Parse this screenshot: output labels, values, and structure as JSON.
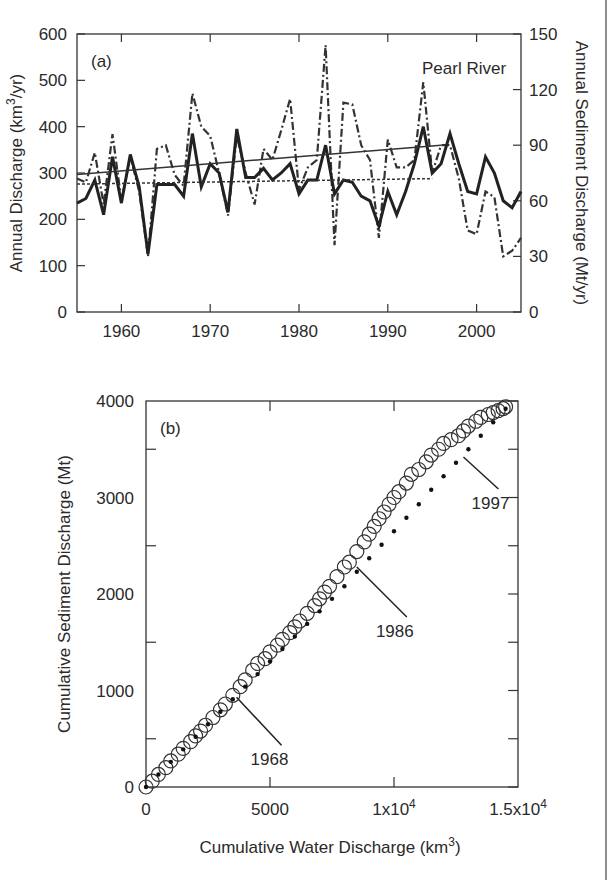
{
  "figure": {
    "border_right": true
  },
  "chart_data": [
    {
      "type": "line",
      "panel_label": "(a)",
      "title": "Pearl River",
      "xlabel": "",
      "ylabel": "Annual Discharge (km³/yr)",
      "ylabel_parts": {
        "pre": "Annual Discharge (km",
        "sup": "3",
        "post": "/yr)"
      },
      "y2label": "Annual Sediment Discharge (Mt/yr)",
      "xlim": [
        1955,
        2005
      ],
      "ylim": [
        0,
        600
      ],
      "y2lim": [
        0,
        150
      ],
      "xticks": [
        1960,
        1970,
        1980,
        1990,
        2000
      ],
      "yticks": [
        0,
        100,
        200,
        300,
        400,
        500,
        600
      ],
      "y2ticks": [
        0,
        30,
        60,
        90,
        120,
        150
      ],
      "grid": false,
      "x": [
        1955,
        1956,
        1957,
        1958,
        1959,
        1960,
        1961,
        1962,
        1963,
        1964,
        1965,
        1966,
        1967,
        1968,
        1969,
        1970,
        1971,
        1972,
        1973,
        1974,
        1975,
        1976,
        1977,
        1978,
        1979,
        1980,
        1981,
        1982,
        1983,
        1984,
        1985,
        1986,
        1987,
        1988,
        1989,
        1990,
        1991,
        1992,
        1993,
        1994,
        1995,
        1996,
        1997,
        1998,
        1999,
        2000,
        2001,
        2002,
        2003,
        2004,
        2005
      ],
      "series": [
        {
          "name": "Water discharge",
          "axis": "left",
          "style": "solid-thick",
          "values": [
            235,
            245,
            285,
            210,
            335,
            235,
            340,
            270,
            125,
            275,
            275,
            275,
            250,
            385,
            270,
            320,
            300,
            215,
            395,
            290,
            290,
            310,
            285,
            300,
            320,
            255,
            285,
            285,
            360,
            255,
            285,
            280,
            250,
            240,
            185,
            260,
            210,
            260,
            320,
            400,
            300,
            320,
            385,
            320,
            260,
            255,
            335,
            300,
            240,
            225,
            260
          ]
        },
        {
          "name": "Sediment discharge",
          "axis": "right",
          "style": "dash-dot",
          "values": [
            72,
            70,
            86,
            58,
            96,
            60,
            84,
            65,
            30,
            88,
            90,
            74,
            68,
            118,
            100,
            95,
            75,
            52,
            95,
            75,
            58,
            88,
            82,
            98,
            115,
            66,
            78,
            82,
            144,
            36,
            113,
            112,
            90,
            82,
            40,
            93,
            78,
            78,
            82,
            124,
            75,
            90,
            90,
            72,
            44,
            42,
            65,
            62,
            30,
            33,
            40
          ]
        },
        {
          "name": "Water discharge trend",
          "axis": "left",
          "style": "solid-thin",
          "x": [
            1955,
            1996
          ],
          "values": [
            297,
            360
          ]
        },
        {
          "name": "Sediment discharge trend",
          "axis": "right",
          "style": "dotted",
          "x": [
            1955,
            1995
          ],
          "values": [
            69,
            72
          ]
        }
      ]
    },
    {
      "type": "scatter",
      "panel_label": "(b)",
      "xlabel": "Cumulative Water Discharge (km³)",
      "xlabel_parts": {
        "pre": "Cumulative Water Discharge (km",
        "sup": "3",
        "post": ")"
      },
      "ylabel": "Cumulative Sediment Discharge (Mt)",
      "xlim": [
        0,
        15000
      ],
      "ylim": [
        0,
        4000
      ],
      "xticks": [
        0,
        5000,
        10000,
        15000
      ],
      "xtick_labels": [
        {
          "base": "0"
        },
        {
          "base": "5000"
        },
        {
          "base": "1x10",
          "sup": "4"
        },
        {
          "base": "1.5x10",
          "sup": "4"
        }
      ],
      "yticks": [
        0,
        1000,
        2000,
        3000,
        4000
      ],
      "yminor": [
        500,
        1500,
        2500,
        3500
      ],
      "grid": false,
      "annotations": [
        {
          "text": "1968",
          "x": 3650,
          "y": 930
        },
        {
          "text": "1986",
          "x": 8500,
          "y": 2280
        },
        {
          "text": "1997",
          "x": 12800,
          "y": 3420
        }
      ],
      "series": [
        {
          "name": "Observed (open circles)",
          "marker": "open-circle",
          "x": [
            0,
            250,
            500,
            800,
            1000,
            1300,
            1500,
            1800,
            2000,
            2200,
            2400,
            2700,
            3000,
            3200,
            3500,
            3800,
            4000,
            4300,
            4500,
            4800,
            5000,
            5300,
            5500,
            5800,
            6000,
            6200,
            6500,
            6800,
            7000,
            7200,
            7400,
            7700,
            8000,
            8200,
            8500,
            8800,
            9000,
            9200,
            9400,
            9600,
            9800,
            10000,
            10200,
            10500,
            10700,
            11000,
            11300,
            11500,
            11800,
            12000,
            12300,
            12600,
            12800,
            13000,
            13300,
            13500,
            13800,
            14000,
            14200,
            14400,
            14500
          ],
          "values": [
            0,
            60,
            130,
            200,
            270,
            340,
            400,
            470,
            530,
            580,
            640,
            720,
            800,
            860,
            950,
            1040,
            1110,
            1210,
            1280,
            1330,
            1400,
            1470,
            1530,
            1600,
            1660,
            1720,
            1800,
            1880,
            1950,
            2020,
            2080,
            2180,
            2280,
            2330,
            2440,
            2540,
            2620,
            2700,
            2780,
            2850,
            2930,
            3000,
            3060,
            3150,
            3240,
            3290,
            3370,
            3440,
            3500,
            3560,
            3600,
            3640,
            3690,
            3740,
            3790,
            3830,
            3860,
            3880,
            3900,
            3920,
            3940
          ]
        },
        {
          "name": "Fitted (dots)",
          "marker": "dot",
          "x": [
            0,
            500,
            1000,
            1500,
            2000,
            2500,
            3000,
            3500,
            4000,
            4500,
            5000,
            5500,
            6000,
            6500,
            7000,
            7500,
            8000,
            8500,
            9000,
            9500,
            10000,
            10500,
            11000,
            11500,
            12000,
            12500,
            13000,
            13500,
            14000,
            14500
          ],
          "values": [
            0,
            130,
            260,
            390,
            520,
            650,
            780,
            910,
            1040,
            1170,
            1300,
            1430,
            1560,
            1690,
            1820,
            1950,
            2080,
            2230,
            2370,
            2510,
            2650,
            2790,
            2930,
            3080,
            3220,
            3360,
            3500,
            3640,
            3780,
            3920
          ]
        }
      ]
    }
  ]
}
